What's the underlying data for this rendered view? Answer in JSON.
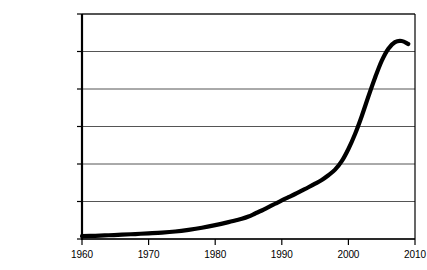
{
  "chart_data": {
    "type": "line",
    "title": "",
    "subtitle": "",
    "xlabel": "",
    "ylabel": "",
    "xlim": [
      1960,
      2010
    ],
    "ylim": [
      0,
      12000000
    ],
    "grid": true,
    "legend": null,
    "y_tick_labels": [
      "$12,000,000",
      "$10,000,000",
      "$8,000,000",
      "$6,000,000",
      "$4,000,000",
      "$2,000,000",
      "0"
    ],
    "y_tick_values": [
      12000000,
      10000000,
      8000000,
      6000000,
      4000000,
      2000000,
      0
    ],
    "x_tick_labels": [
      "1960",
      "1970",
      "1980",
      "1990",
      "2000",
      "2010"
    ],
    "x_tick_values": [
      1960,
      1970,
      1980,
      1990,
      2000,
      2010
    ],
    "series": [
      {
        "name": "",
        "color": "#000000",
        "x": [
          1960,
          1962,
          1964,
          1966,
          1968,
          1970,
          1972,
          1974,
          1976,
          1978,
          1980,
          1982,
          1983,
          1984,
          1985,
          1986,
          1987,
          1988,
          1989,
          1990,
          1991,
          1992,
          1993,
          1994,
          1995,
          1996,
          1997,
          1998,
          1999,
          2000,
          2001,
          2002,
          2003,
          2004,
          2005,
          2006,
          2007,
          2008,
          2009
        ],
        "values": [
          150000,
          170000,
          200000,
          230000,
          265000,
          300000,
          340000,
          400000,
          490000,
          600000,
          740000,
          900000,
          990000,
          1080000,
          1200000,
          1360000,
          1520000,
          1700000,
          1880000,
          2060000,
          2230000,
          2400000,
          2580000,
          2760000,
          2950000,
          3150000,
          3400000,
          3700000,
          4150000,
          4800000,
          5600000,
          6550000,
          7600000,
          8600000,
          9500000,
          10150000,
          10500000,
          10560000,
          10400000
        ]
      }
    ]
  },
  "axes": {
    "plot_left_px": 82,
    "plot_right_px": 415,
    "plot_top_px": 14,
    "plot_bottom_px": 239,
    "axis_color": "#000000",
    "grid_color": "#555555",
    "background": "#ffffff"
  }
}
